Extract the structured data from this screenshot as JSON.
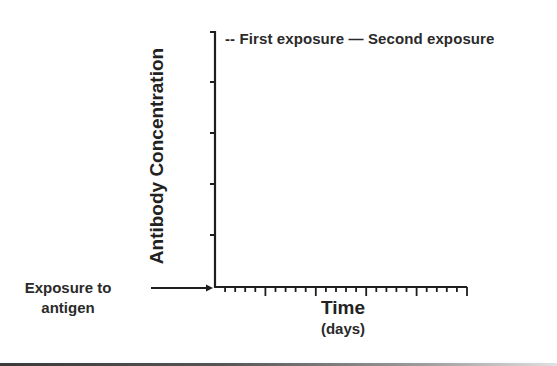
{
  "chart_data": {
    "type": "line",
    "title": "",
    "xlabel": "Time",
    "xlabel_unit": "(days)",
    "ylabel": "Antibody Concentration",
    "legend": {
      "position": "top",
      "entries": [
        {
          "name": "First exposure",
          "style": "dashed",
          "symbol": "--"
        },
        {
          "name": "Second exposure",
          "style": "solid",
          "symbol": "—"
        }
      ]
    },
    "series": [
      {
        "name": "First exposure",
        "values": []
      },
      {
        "name": "Second exposure",
        "values": []
      }
    ],
    "x_ticks": {
      "minor_count": 25,
      "major_every": 5
    },
    "y_ticks": {
      "count": 5
    },
    "annotations": [
      {
        "text": "Exposure to antigen",
        "arrow_to": "origin"
      }
    ],
    "grid": false
  },
  "legend": {
    "first_symbol": "--",
    "first_label": "First exposure",
    "second_symbol": "—",
    "second_label": "Second exposure"
  },
  "axes": {
    "y_label": "Antibody Concentration",
    "x_label": "Time",
    "x_unit": "(days)"
  },
  "annotation": {
    "line1": "Exposure to",
    "line2": "antigen"
  },
  "colors": {
    "axis": "#1e1e1e",
    "text": "#222222",
    "background": "#ffffff"
  }
}
